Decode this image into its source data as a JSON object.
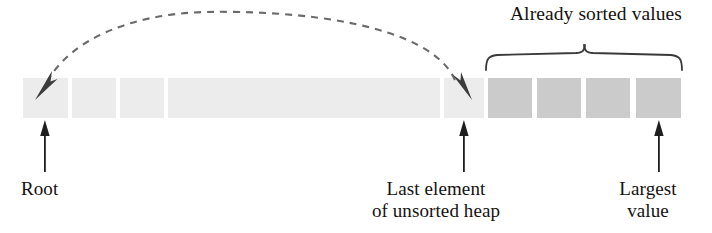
{
  "figure": {
    "kind": "heapsort-array-diagram",
    "title": "",
    "colors": {
      "unsorted_cell": "#ececec",
      "sorted_cell": "#cbcbcb",
      "ink": "#2b2b2b",
      "dashed_arrow": "#6b6b6b",
      "background": "#ffffff"
    }
  },
  "annotations": {
    "sorted_region_label": "Already sorted values",
    "root_label": "Root",
    "last_element_label": "Last element\nof unsorted heap",
    "largest_value_label": "Largest\nvalue"
  },
  "cells": {
    "unsorted": [
      {
        "name": "root-cell",
        "x": 23,
        "width": 45,
        "fill": "#ececec"
      },
      {
        "name": "unsorted-cell-2",
        "x": 72,
        "width": 44,
        "fill": "#ececec"
      },
      {
        "name": "unsorted-cell-3",
        "x": 120,
        "width": 44,
        "fill": "#ececec"
      },
      {
        "name": "unsorted-cell-span",
        "x": 168,
        "width": 272,
        "fill": "#ececec"
      },
      {
        "name": "last-unsorted-cell",
        "x": 444,
        "width": 40,
        "fill": "#ececec"
      }
    ],
    "sorted": [
      {
        "name": "sorted-cell-1",
        "x": 488,
        "width": 44,
        "fill": "#cbcbcb"
      },
      {
        "name": "sorted-cell-2",
        "x": 537,
        "width": 44,
        "fill": "#cbcbcb"
      },
      {
        "name": "sorted-cell-3",
        "x": 586,
        "width": 44,
        "fill": "#cbcbcb"
      },
      {
        "name": "sorted-cell-4",
        "x": 636,
        "width": 45,
        "fill": "#cbcbcb"
      }
    ],
    "row": {
      "y": 78,
      "height": 40
    }
  },
  "markers": {
    "swap_arrow": {
      "name": "swap-dashed-double-arrow",
      "from_x": 464,
      "to_x": 40,
      "apex_y": 22,
      "base_y": 88,
      "style": "dashed",
      "double_headed": true
    },
    "brace": {
      "x_start": 486,
      "x_end": 682,
      "y": 52,
      "depth": 18
    },
    "pointer_arrows": [
      {
        "name": "root-pointer-arrow",
        "x": 45,
        "y_top": 121,
        "y_bottom": 172
      },
      {
        "name": "last-element-pointer-arrow",
        "x": 464,
        "y_top": 121,
        "y_bottom": 172
      },
      {
        "name": "largest-value-pointer-arrow",
        "x": 659,
        "y_top": 121,
        "y_bottom": 172
      }
    ]
  }
}
